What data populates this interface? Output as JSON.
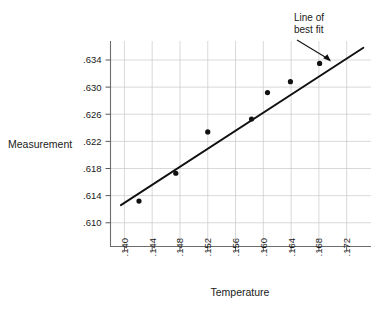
{
  "chart_data": {
    "type": "scatter",
    "title": "",
    "xlabel": "Temperature",
    "ylabel": "Measurement",
    "xlim": [
      0.138,
      0.1755
    ],
    "ylim": [
      0.6065,
      0.6368
    ],
    "grid": true,
    "legend": null,
    "x_ticks": [
      ".140",
      ".144",
      ".148",
      ".152",
      ".156",
      ".160",
      ".164",
      ".168",
      ".172"
    ],
    "x_tick_values": [
      0.14,
      0.144,
      0.148,
      0.152,
      0.156,
      0.16,
      0.164,
      0.168,
      0.172
    ],
    "y_ticks": [
      ".634",
      ".630",
      ".626",
      ".622",
      ".618",
      ".614",
      ".610"
    ],
    "y_tick_values": [
      0.634,
      0.63,
      0.626,
      0.622,
      0.618,
      0.614,
      0.61
    ],
    "points": [
      {
        "x": 0.1421,
        "y": 0.6132
      },
      {
        "x": 0.1474,
        "y": 0.6173
      },
      {
        "x": 0.152,
        "y": 0.6234
      },
      {
        "x": 0.1583,
        "y": 0.6253
      },
      {
        "x": 0.1606,
        "y": 0.6292
      },
      {
        "x": 0.1639,
        "y": 0.6308
      },
      {
        "x": 0.1681,
        "y": 0.6335
      }
    ],
    "series": [
      {
        "name": "Measurements",
        "type": "scatter",
        "x": [
          0.1421,
          0.1474,
          0.152,
          0.1583,
          0.1606,
          0.1639,
          0.1681
        ],
        "values": [
          0.6132,
          0.6173,
          0.6234,
          0.6253,
          0.6292,
          0.6308,
          0.6335
        ]
      },
      {
        "name": "Line of best fit",
        "type": "line",
        "x": [
          0.1395,
          0.1744
        ],
        "values": [
          0.6126,
          0.6358
        ]
      }
    ],
    "annotations": [
      {
        "name": "line-of-best-fit",
        "text_line1": "Line of",
        "text_line2": "best fit",
        "points_to_x": 0.1676,
        "points_to_y": 0.635
      }
    ]
  },
  "axes": {
    "x_title": "Temperature",
    "y_title": "Measurement"
  },
  "annotation": {
    "line1": "Line of",
    "line2": "best fit"
  },
  "colors": {
    "ink": "#111111",
    "grid": "#c9c9c9",
    "axis": "#6d6d6d",
    "background": "#ffffff"
  }
}
